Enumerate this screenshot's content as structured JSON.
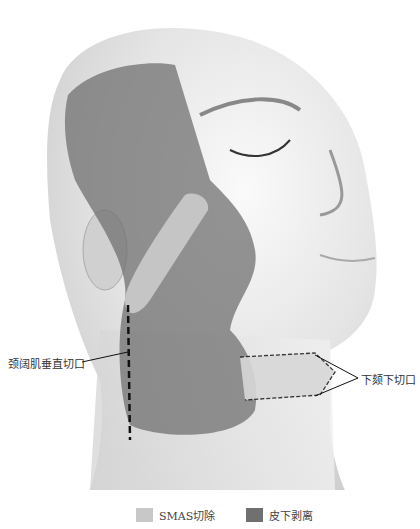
{
  "figure": {
    "labels": {
      "platysma_incision": "颈阔肌垂直切口",
      "submental_incision": "下颏下切口"
    }
  },
  "legend": {
    "items": [
      {
        "label": "SMAS切除",
        "color": "#c8c8c8"
      },
      {
        "label": "皮下剥离",
        "color": "#707070"
      }
    ]
  },
  "colors": {
    "smas_excision": "#c8c8c8",
    "subcutaneous_dissection": "#707070",
    "skin": "#e6e6e6",
    "line": "#222222"
  }
}
